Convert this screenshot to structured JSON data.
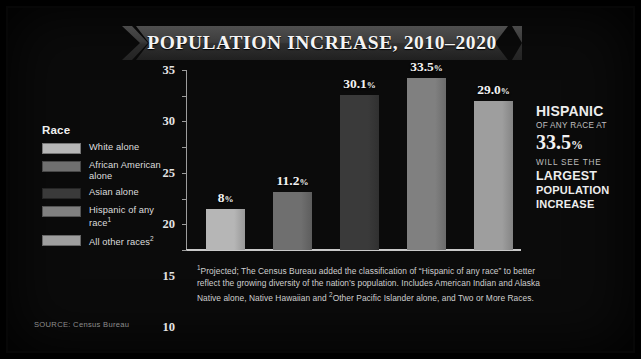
{
  "chart_data": {
    "type": "bar",
    "title": "POPULATION INCREASE, 2010–2020",
    "xlabel": "",
    "ylabel": "",
    "ylim": [
      0,
      35
    ],
    "yticks": [
      0,
      5,
      10,
      15,
      20,
      25,
      30,
      35
    ],
    "grid": false,
    "legend_position": "left",
    "legend_title": "Race",
    "categories": [
      "White alone",
      "African American alone",
      "Asian alone",
      "Hispanic of any race¹",
      "All other races²"
    ],
    "values": [
      8,
      11.2,
      30.1,
      33.5,
      29.0
    ],
    "data_labels": [
      "8",
      "11.2",
      "30.1",
      "33.5",
      "29.0"
    ],
    "value_suffix": "%",
    "bar_colors": [
      "#b6b6b6",
      "#6f6f6f",
      "#3a3a3a",
      "#808080",
      "#9e9e9e"
    ],
    "annotations": [
      "HISPANIC OF ANY RACE AT 33.5% WILL SEE THE LARGEST POPULATION INCREASE"
    ]
  },
  "legend": {
    "title": "Race",
    "items": [
      {
        "label": "White alone",
        "sup": "",
        "color": "#b6b6b6"
      },
      {
        "label": "African American alone",
        "sup": "",
        "color": "#6f6f6f"
      },
      {
        "label": "Asian alone",
        "sup": "",
        "color": "#3a3a3a"
      },
      {
        "label": "Hispanic of any race",
        "sup": "1",
        "color": "#808080"
      },
      {
        "label": "All other races",
        "sup": "2",
        "color": "#9e9e9e"
      }
    ]
  },
  "callout": {
    "hispanic": "HISPANIC",
    "any_race_at": "OF ANY RACE AT",
    "value": "33.5",
    "value_pct": "%",
    "will_see_the": "WILL SEE THE",
    "largest": "LARGEST",
    "population": "POPULATION",
    "increase": "INCREASE"
  },
  "footnote": {
    "marker1": "1",
    "part1": "Projected; The Census Bureau added the classification of “Hispanic of any race” to better reflect the growing diversity of the nation’s population. Includes American Indian and Alaska Native alone, Native Hawaiian and ",
    "marker2": "2",
    "part2": "Other Pacific Islander alone, and Two or More Races."
  },
  "source": {
    "text": "SOURCE: Census Bureau"
  }
}
